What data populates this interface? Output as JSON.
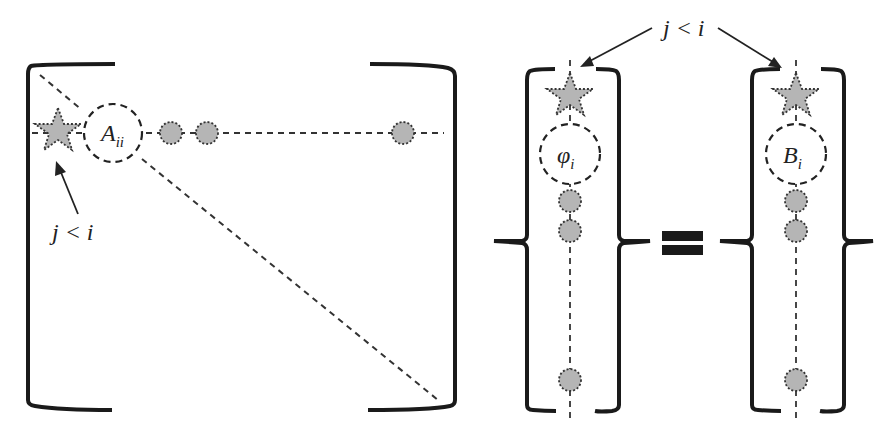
{
  "diagram": {
    "matrix": {
      "diag_label": "A",
      "diag_sub": "ii",
      "star_label": "j < i"
    },
    "vector_phi": {
      "label": "φ",
      "sub": "i"
    },
    "vector_b": {
      "label": "B",
      "sub": "i"
    },
    "top_label": "j < i",
    "colors": {
      "ink": "#1a1a1a",
      "fill": "#b5b5b5",
      "dash": "#333333"
    }
  }
}
